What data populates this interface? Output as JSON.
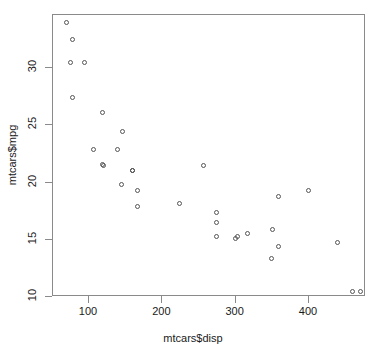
{
  "chart_data": {
    "type": "scatter",
    "title": "",
    "xlabel": "mtcars$disp",
    "ylabel": "mtcars$mpg",
    "xlim": [
      47,
      480
    ],
    "ylim": [
      9.4,
      34.5
    ],
    "xticks": [
      100,
      200,
      300,
      400
    ],
    "yticks": [
      10,
      15,
      20,
      25,
      30
    ],
    "grid": false,
    "legend": null,
    "point_symbol": "open-circle",
    "point_color": "#555555",
    "x": [
      160,
      160,
      108,
      258,
      360,
      225,
      360,
      146.7,
      140.8,
      167.6,
      167.6,
      275.8,
      275.8,
      275.8,
      472,
      460,
      440,
      78.7,
      75.7,
      71.1,
      120.1,
      318,
      304,
      350,
      400,
      79,
      120.3,
      95.1,
      351,
      145,
      301,
      121
    ],
    "y": [
      21,
      21,
      22.8,
      21.4,
      18.7,
      18.1,
      14.3,
      24.4,
      22.8,
      19.2,
      17.8,
      16.4,
      17.3,
      15.2,
      10.4,
      10.4,
      14.7,
      32.4,
      30.4,
      33.9,
      21.5,
      15.5,
      15.2,
      13.3,
      19.2,
      27.3,
      26,
      30.4,
      15.8,
      19.7,
      15,
      21.4
    ],
    "n_points": 32
  },
  "axis": {
    "x_tick_labels": [
      "100",
      "200",
      "300",
      "400"
    ],
    "y_tick_labels": [
      "10",
      "15",
      "20",
      "25",
      "30"
    ],
    "x_title": "mtcars$disp",
    "y_title": "mtcars$mpg"
  },
  "style": {
    "frame_color": "#8a8a8a",
    "point_color": "#555555",
    "background": "#ffffff",
    "text_color": "#1a1a1a"
  }
}
